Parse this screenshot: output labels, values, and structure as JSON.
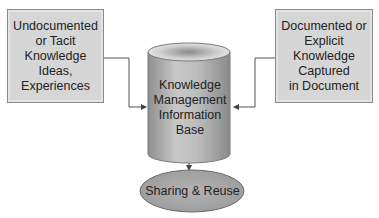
{
  "diagram": {
    "left_box": {
      "lines": [
        "Undocumented",
        "or Tacit",
        "Knowledge",
        "Ideas,",
        "Experiences"
      ]
    },
    "right_box": {
      "lines": [
        "Documented or",
        "Explicit",
        "Knowledge",
        "Captured",
        "in Document"
      ]
    },
    "cylinder": {
      "lines": [
        "Knowledge",
        "Management",
        "Information",
        "Base"
      ]
    },
    "ellipse": {
      "label": "Sharing & Reuse"
    },
    "colors": {
      "box_fill": "#d6d6d6",
      "cylinder_fill": "#b5b5b5",
      "ellipse_fill": "#a9a9a9",
      "line": "#555555"
    }
  }
}
